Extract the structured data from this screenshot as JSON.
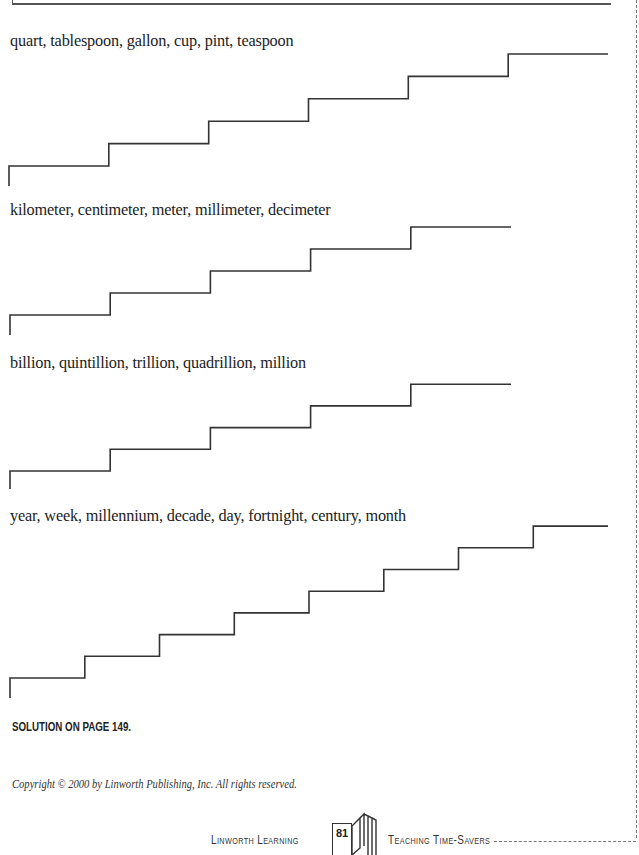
{
  "exercises": [
    {
      "words": "quart, tablespoon, gallon, cup, pint, teaspoon",
      "steps": 6
    },
    {
      "words": "kilometer, centimeter, meter, millimeter, decimeter",
      "steps": 5
    },
    {
      "words": "billion, quintillion, trillion, quadrillion, million",
      "steps": 5
    },
    {
      "words": "year, week, millennium, decade, day, fortnight, century, month",
      "steps": 8
    }
  ],
  "solution_note": "SOLUTION ON PAGE 149.",
  "copyright": "Copyright © 2000 by Linworth Publishing, Inc. All rights reserved.",
  "footer": {
    "publisher": "Linworth Learning",
    "page_number": "81",
    "series": "Teaching Time-Savers"
  }
}
